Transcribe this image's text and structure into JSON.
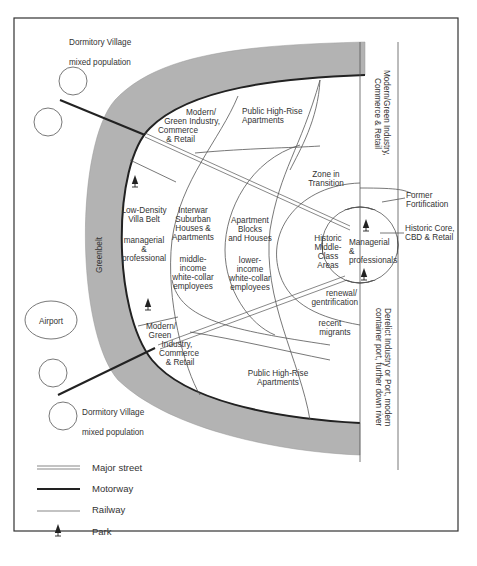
{
  "diagram": {
    "colors": {
      "greenbelt": "#b3b3b3",
      "frame": "#333333",
      "line": "#555555",
      "motorway": "#222222",
      "text": "#333333"
    },
    "outside": {
      "dormitory_top_1": "Dormitory Village",
      "dormitory_top_2": "mixed population",
      "airport": "Airport",
      "dormitory_bottom_1": "Dormitory Village",
      "dormitory_bottom_2": "mixed population"
    },
    "greenbelt": "Greenbelt",
    "zones": {
      "north_industry": [
        "Modern/",
        "Green Industry,",
        "Commerce",
        "& Retail"
      ],
      "north_highrise": [
        "Public High-Rise",
        "Apartments"
      ],
      "villa_belt": [
        "Low-Density",
        "Villa Belt",
        "",
        "managerial",
        "&",
        "professional"
      ],
      "interwar": [
        "Interwar",
        "Suburban",
        "Houses &",
        "Apartments",
        "",
        "middle-",
        "income",
        "white-collar",
        "employees"
      ],
      "apartment_blocks": [
        "Apartment",
        "Blocks",
        "and Houses",
        "",
        "lower-",
        "income",
        "white-collar",
        "employees"
      ],
      "zone_transition": [
        "Zone in",
        "Transition"
      ],
      "historic_middle": [
        "Historic",
        "Middle-",
        "Class",
        "Areas"
      ],
      "core_center": [
        "Managerial",
        "&",
        "professionals"
      ],
      "renewal": [
        "renewal/",
        "gentrification"
      ],
      "recent_migrants": [
        "recent",
        "migrants"
      ],
      "south_industry": [
        "Modern/",
        "Green",
        "Industry,",
        "Commerce",
        "& Retail"
      ],
      "south_highrise": [
        "Public High-Rise",
        "Apartments"
      ]
    },
    "right_labels": {
      "former_fortification": [
        "Former",
        "Fortification"
      ],
      "historic_core": [
        "Historic Core,",
        "CBD & Retail"
      ],
      "strip_top": [
        "Modern/Green Industry,",
        "Commerce & Retail"
      ],
      "strip_bottom": [
        "Derelict Industry or Port, modern",
        "container port, further down river"
      ]
    },
    "legend": [
      {
        "symbol": "double-line",
        "label": "Major street"
      },
      {
        "symbol": "thick-line",
        "label": "Motorway"
      },
      {
        "symbol": "thin-line",
        "label": "Railway"
      },
      {
        "symbol": "tree",
        "label": "Park"
      }
    ]
  }
}
